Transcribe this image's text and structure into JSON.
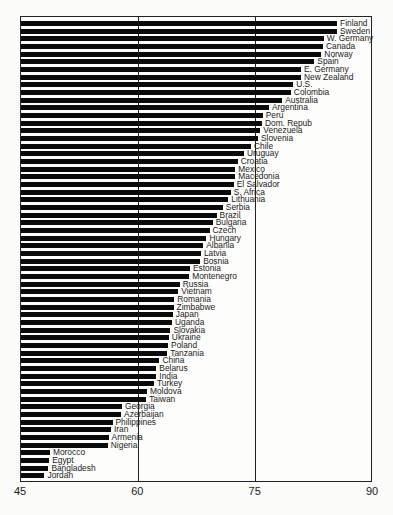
{
  "chart_data": {
    "type": "bar",
    "orientation": "horizontal",
    "title": "",
    "xlabel": "",
    "ylabel": "",
    "xlim": [
      45,
      90
    ],
    "xticks": [
      45,
      60,
      75,
      90
    ],
    "grid": "vertical lines at 60 and 75",
    "legend": null,
    "categories": [
      "Finland",
      "Sweden",
      "W. Germany",
      "Canada",
      "Norway",
      "Spain",
      "E. Germany",
      "New Zealand",
      "U.S.",
      "Colombia",
      "Australia",
      "Argentina",
      "Peru",
      "Dom. Repub",
      "Venezuela",
      "Slovenia",
      "Chile",
      "Uruguay",
      "Croatia",
      "Mexico",
      "Macedonia",
      "El Salvador",
      "S. Africa",
      "Lithuania",
      "Serbia",
      "Brazil",
      "Bulgaria",
      "Czech",
      "Hungary",
      "Albania",
      "Latvia",
      "Bosnia",
      "Estonia",
      "Montenegro",
      "Russia",
      "Vietnam",
      "Romania",
      "Zimbabwe",
      "Japan",
      "Uganda",
      "Slovakia",
      "Ukraine",
      "Poland",
      "Tanzania",
      "China",
      "Belarus",
      "India",
      "Turkey",
      "Moldova",
      "Taiwan",
      "Georgia",
      "Azerbaijan",
      "Philippines",
      "Iran",
      "Armenia",
      "Nigeria",
      "Morocco",
      "Egypt",
      "Bangladesh",
      "Jordan"
    ],
    "values": [
      85.4,
      85.4,
      83.7,
      83.6,
      83.4,
      82.5,
      80.8,
      80.8,
      79.8,
      79.5,
      78.4,
      76.7,
      75.9,
      75.8,
      75.6,
      75.3,
      74.4,
      73.5,
      72.7,
      72.4,
      72.4,
      72.2,
      71.8,
      71.5,
      70.8,
      70.0,
      69.5,
      69.1,
      68.7,
      68.3,
      68.0,
      67.9,
      66.6,
      66.5,
      65.3,
      65.1,
      64.6,
      64.5,
      64.4,
      64.3,
      64.1,
      63.9,
      63.8,
      63.7,
      62.7,
      62.3,
      62.3,
      62.0,
      61.1,
      61.0,
      57.9,
      57.8,
      56.7,
      56.5,
      56.2,
      56.1,
      48.7,
      48.6,
      48.5,
      48.0
    ]
  }
}
